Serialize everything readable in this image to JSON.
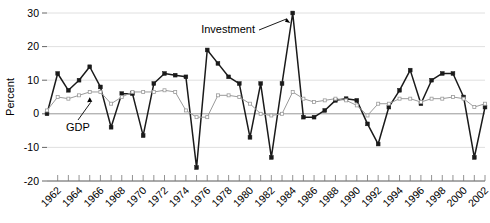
{
  "chart_data": {
    "type": "line",
    "title": "",
    "xlabel": "",
    "ylabel": "Percent",
    "ylim": [
      -20,
      30
    ],
    "xlim": [
      1961,
      2002
    ],
    "yticks": [
      -20,
      -10,
      0,
      10,
      20,
      30
    ],
    "ytick_labels": [
      "-20",
      "-10",
      "0",
      "10",
      "20",
      "30"
    ],
    "grid": true,
    "grid_axis": "y",
    "legend_position": "inline-annotations",
    "x_tick_interval_years": 1,
    "x_label_interval_years": 2,
    "x_label_rotation_deg": 45,
    "xtick_labels": [
      "1962",
      "1964",
      "1966",
      "1968",
      "1970",
      "1972",
      "1974",
      "1976",
      "1978",
      "1980",
      "1982",
      "1984",
      "1986",
      "1988",
      "1990",
      "1992",
      "1994",
      "1996",
      "1998",
      "2000",
      "2002"
    ],
    "x": [
      1961,
      1962,
      1963,
      1964,
      1965,
      1966,
      1967,
      1968,
      1969,
      1970,
      1971,
      1972,
      1973,
      1974,
      1975,
      1976,
      1977,
      1978,
      1979,
      1980,
      1981,
      1982,
      1983,
      1984,
      1985,
      1986,
      1987,
      1988,
      1989,
      1990,
      1991,
      1992,
      1993,
      1994,
      1995,
      1996,
      1997,
      1998,
      1999,
      2000,
      2001,
      2002
    ],
    "series": [
      {
        "name": "Investment",
        "color": "#1a1a1a",
        "marker": "square-filled",
        "values": [
          0,
          12,
          7,
          10,
          14,
          8,
          -4,
          6,
          6,
          -6.5,
          9,
          12,
          11.5,
          11,
          -16,
          19,
          15,
          11,
          9,
          -7,
          9,
          -13,
          9,
          30,
          -1,
          -1,
          1,
          4,
          4.5,
          4,
          -3,
          -9,
          2,
          7,
          13,
          3,
          10,
          12,
          12,
          5,
          -13,
          2
        ]
      },
      {
        "name": "GDP",
        "color": "#9a9a9a",
        "marker": "square-open",
        "values": [
          1,
          5,
          4.5,
          5.5,
          6.5,
          6.5,
          3,
          5,
          6.5,
          6.5,
          6.5,
          7,
          6.5,
          1,
          -1,
          -1,
          5.5,
          5.5,
          5,
          3,
          0,
          -0.5,
          0,
          6.5,
          4.5,
          3.5,
          4,
          4.5,
          4,
          2.5,
          -0.5,
          3,
          3,
          4.5,
          4.5,
          3.5,
          4.5,
          4.5,
          5,
          4.5,
          2,
          3
        ]
      }
    ],
    "annotations": [
      {
        "text": "Investment",
        "anchor_year": 1984,
        "anchor_value": 27
      },
      {
        "text": "GDP",
        "anchor_year": 1965,
        "anchor_value": 5.5
      }
    ]
  }
}
